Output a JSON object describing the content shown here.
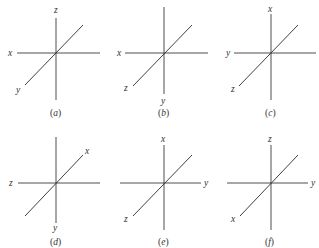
{
  "figure": {
    "panels": [
      {
        "id": "a",
        "caption_open": "(",
        "caption_letter": "a",
        "caption_close": ")",
        "origin": [
          56,
          53
        ],
        "vertical_top_label": "z",
        "vertical_bottom_label": "",
        "horizontal_left_label": "x",
        "horizontal_right_label": "",
        "diagonal_lower_left_label": "y",
        "diagonal_upper_right_label": ""
      },
      {
        "id": "b",
        "caption_open": "(",
        "caption_letter": "b",
        "caption_close": ")",
        "origin": [
          164,
          53
        ],
        "vertical_top_label": "",
        "vertical_bottom_label": "y",
        "horizontal_left_label": "x",
        "horizontal_right_label": "",
        "diagonal_lower_left_label": "z",
        "diagonal_upper_right_label": ""
      },
      {
        "id": "c",
        "caption_open": "(",
        "caption_letter": "c",
        "caption_close": ")",
        "origin": [
          270,
          53
        ],
        "vertical_top_label": "x",
        "vertical_bottom_label": "",
        "horizontal_left_label": "y",
        "horizontal_right_label": "",
        "diagonal_lower_left_label": "z",
        "diagonal_upper_right_label": ""
      },
      {
        "id": "d",
        "caption_open": "(",
        "caption_letter": "d",
        "caption_close": ")",
        "origin": [
          56,
          183
        ],
        "vertical_top_label": "",
        "vertical_bottom_label": "y",
        "horizontal_left_label": "z",
        "horizontal_right_label": "",
        "diagonal_lower_left_label": "",
        "diagonal_upper_right_label": "x"
      },
      {
        "id": "e",
        "caption_open": "(",
        "caption_letter": "e",
        "caption_close": ")",
        "origin": [
          164,
          183
        ],
        "vertical_top_label": "x",
        "vertical_bottom_label": "",
        "horizontal_left_label": "",
        "horizontal_right_label": "y",
        "diagonal_lower_left_label": "z",
        "diagonal_upper_right_label": ""
      },
      {
        "id": "f",
        "caption_open": "(",
        "caption_letter": "f",
        "caption_close": ")",
        "origin": [
          271,
          183
        ],
        "vertical_top_label": "z",
        "vertical_bottom_label": "",
        "horizontal_left_label": "",
        "horizontal_right_label": "y",
        "diagonal_lower_left_label": "x",
        "diagonal_upper_right_label": ""
      }
    ]
  }
}
